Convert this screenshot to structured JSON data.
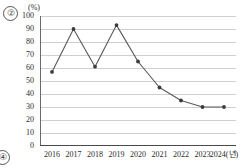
{
  "annotations": {
    "marker_top_left": "②",
    "marker_bottom_left": "④"
  },
  "chart_data": {
    "type": "line",
    "title": "",
    "subtitle": "",
    "xlabel": "",
    "ylabel": "",
    "unit_label": "(%)",
    "categories": [
      "2016",
      "2017",
      "2018",
      "2019",
      "2020",
      "2021",
      "2022",
      "2023",
      "2024"
    ],
    "x_tick_labels": [
      "2016",
      "2017",
      "2018",
      "2019",
      "2020",
      "2021",
      "2022",
      "2023",
      "2024(년)"
    ],
    "values": [
      57,
      90,
      61,
      93,
      65,
      45,
      35,
      30,
      30
    ],
    "y_tick_labels": [
      "100",
      "90",
      "80",
      "70",
      "60",
      "50",
      "40",
      "30",
      "20",
      "10",
      "0"
    ],
    "y_ticks": [
      100,
      90,
      80,
      70,
      60,
      50,
      40,
      30,
      20,
      10,
      0
    ],
    "ylim": [
      0,
      100
    ],
    "grid": true,
    "grid_axis": "y",
    "legend": false,
    "legend_position": "none",
    "marker": "filled-circle",
    "series_color": "#585858",
    "marker_color": "#3b3b3b",
    "gridline_color": "#cfcfcf",
    "axis_color": "#4a4a4a"
  }
}
